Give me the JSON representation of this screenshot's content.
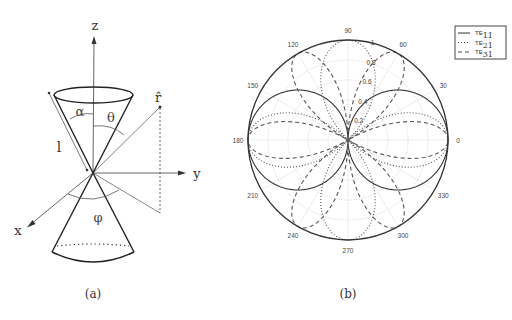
{
  "figure_a": {
    "caption": "(a)",
    "axes": {
      "z": "z",
      "y": "y",
      "x": "x"
    },
    "labels": {
      "alpha": "α",
      "theta": "θ",
      "phi": "φ",
      "length": "l",
      "rhat": "r̂"
    }
  },
  "figure_b": {
    "caption": "(b)"
  },
  "chart_data": {
    "type": "polar-line",
    "title": "",
    "angle_ticks_deg": [
      0,
      30,
      60,
      90,
      120,
      150,
      180,
      210,
      240,
      270,
      300,
      330
    ],
    "angle_tick_labels": [
      "0",
      "30",
      "60",
      "90",
      "120",
      "150",
      "180",
      "210",
      "240",
      "270",
      "300",
      "330"
    ],
    "radial_ticks": [
      0.2,
      0.4,
      0.6,
      0.8,
      1
    ],
    "radial_tick_labels": [
      "0.2",
      "0.4",
      "0.6",
      "0.8",
      "1"
    ],
    "rlim": [
      0,
      1
    ],
    "grid": true,
    "legend_position": "upper right",
    "series": [
      {
        "name": "TE11",
        "label_main": "TE",
        "label_sub": "11",
        "style": "solid",
        "function": "|cos(θ)|"
      },
      {
        "name": "TE21",
        "label_main": "TE",
        "label_sub": "21",
        "style": "dotted",
        "function": "|cos(2θ)|"
      },
      {
        "name": "TE31",
        "label_main": "TE",
        "label_sub": "31",
        "style": "dashed",
        "function": "|cos(3θ)|"
      }
    ]
  }
}
